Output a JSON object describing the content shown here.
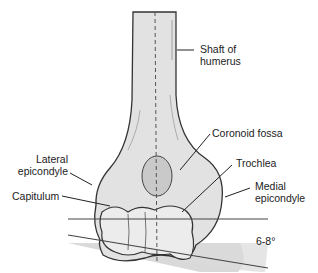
{
  "diagram": {
    "labels": {
      "shaft": "Shaft of\nhumerus",
      "coronoid_fossa": "Coronoid fossa",
      "lateral_epicondyle": "Lateral\nepicondyle",
      "trochlea": "Trochlea",
      "capitulum": "Capitulum",
      "medial_epicondyle": "Medial\nepicondyle",
      "angle": "6-8°"
    },
    "colors": {
      "bone_fill": "#e2e2e2",
      "bone_shadow": "#c9c9c9",
      "outline": "#333333",
      "angle_wedge": "#d9d9d9",
      "text": "#222222"
    }
  }
}
